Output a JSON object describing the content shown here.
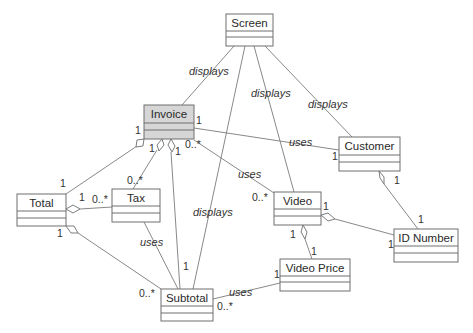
{
  "diagram": {
    "type": "uml-class-diagram",
    "classes": [
      {
        "id": "screen",
        "name": "Screen",
        "highlighted": false
      },
      {
        "id": "invoice",
        "name": "Invoice",
        "highlighted": true
      },
      {
        "id": "customer",
        "name": "Customer",
        "highlighted": false
      },
      {
        "id": "tax",
        "name": "Tax",
        "highlighted": false
      },
      {
        "id": "total",
        "name": "Total",
        "highlighted": false
      },
      {
        "id": "video",
        "name": "Video",
        "highlighted": false
      },
      {
        "id": "id_number",
        "name": "ID Number",
        "highlighted": false
      },
      {
        "id": "video_price",
        "name": "Video Price",
        "highlighted": false
      },
      {
        "id": "subtotal",
        "name": "Subtotal",
        "highlighted": false
      }
    ],
    "labels": {
      "screen_invoice": "displays",
      "screen_video": "displays",
      "screen_customer": "displays",
      "screen_subtotal": "displays",
      "invoice_customer": "uses",
      "invoice_video": "uses",
      "tax_subtotal": "uses",
      "subtotal_videoprice": "uses"
    },
    "multiplicities": {
      "invoice_customer_at_invoice": "1",
      "invoice_customer_at_customer": "1",
      "invoice_total_at_invoice": "1",
      "invoice_total_at_total": "1",
      "invoice_tax_at_invoice": "1",
      "invoice_tax_at_tax": "0..*",
      "invoice_subtotal_at_invoice": "1",
      "invoice_subtotal_at_subtotal": "1",
      "invoice_video_at_invoice": "0..*",
      "invoice_video_at_video": "0..*",
      "total_tax_at_total": "1",
      "total_tax_at_tax": "0..*",
      "total_subtotal_at_total": "1",
      "total_subtotal_at_subtotal": "0..*",
      "subtotal_videoprice_at_subtotal": "0..*",
      "subtotal_videoprice_at_videoprice": "1",
      "customer_idnumber_at_customer": "1",
      "customer_idnumber_at_idnumber": "1",
      "video_idnumber_at_video": "1",
      "video_idnumber_at_idnumber": "1",
      "video_videoprice_at_video": "1",
      "video_videoprice_at_videoprice": "1"
    },
    "colors": {
      "highlight_fill": "#d6d6d6",
      "stroke": "#6e6e6e"
    }
  }
}
